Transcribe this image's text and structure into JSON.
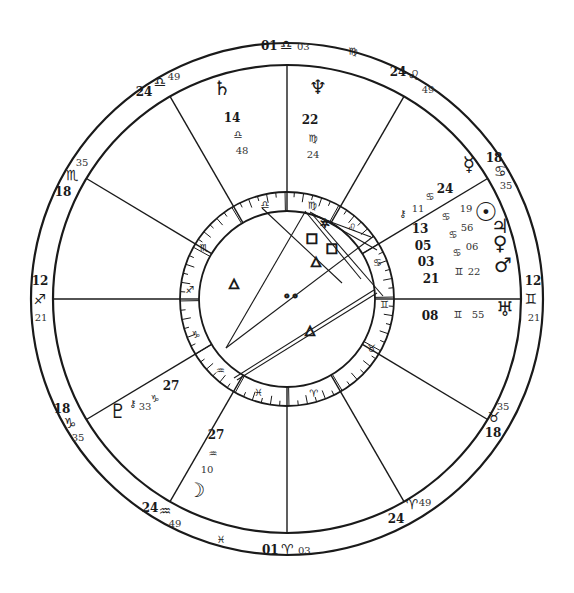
{
  "chart_meta": {
    "type": "natal-wheel",
    "center": [
      287,
      299
    ],
    "radii": {
      "outer": 256,
      "cusp_ring": 234,
      "zodiac_outer": 107,
      "zodiac_inner": 88
    },
    "line_color": "#1a1a1a",
    "background": "#ffffff"
  },
  "house_cusps": [
    {
      "id": "mc",
      "deg": "01",
      "sign": "♎",
      "min": "03",
      "angle": -90
    },
    {
      "id": "c11",
      "deg": "24",
      "sign": "♌",
      "min": "49",
      "angle": -60,
      "deg_pos": [
        398,
        76
      ],
      "sign_pos": [
        414,
        80
      ],
      "min_pos": [
        428,
        93
      ]
    },
    {
      "id": "c12",
      "deg": "18",
      "sign": "♋",
      "min": "35",
      "angle": -31,
      "deg_pos": [
        494,
        162
      ],
      "sign_pos": [
        500,
        176
      ],
      "min_pos": [
        506,
        189
      ]
    },
    {
      "id": "asc",
      "deg": "12",
      "sign": "♊",
      "min": "21",
      "angle": 0,
      "deg_pos": [
        533,
        285
      ],
      "sign_pos": [
        531,
        304
      ],
      "min_pos": [
        534,
        321
      ]
    },
    {
      "id": "c2",
      "deg": "18",
      "sign": "♉",
      "min": "35",
      "angle": 31,
      "deg_pos": [
        493,
        437
      ],
      "sign_pos": [
        494,
        422
      ],
      "min_pos": [
        503,
        410
      ]
    },
    {
      "id": "c3",
      "deg": "24",
      "sign": "♈",
      "min": "49",
      "angle": 60,
      "deg_pos": [
        396,
        523
      ],
      "sign_pos": [
        412,
        509
      ],
      "min_pos": [
        425,
        506
      ]
    },
    {
      "id": "ic",
      "deg": "01",
      "sign": "♈",
      "min": "03",
      "angle": 90
    },
    {
      "id": "c5",
      "deg": "24",
      "sign": "♒",
      "min": "49",
      "angle": 120,
      "deg_pos": [
        150,
        512
      ],
      "sign_pos": [
        165,
        516
      ],
      "min_pos": [
        175,
        527
      ]
    },
    {
      "id": "c6",
      "deg": "18",
      "sign": "♑",
      "min": "35",
      "angle": 149,
      "deg_pos": [
        62,
        413
      ],
      "sign_pos": [
        70,
        428
      ],
      "min_pos": [
        78,
        441
      ]
    },
    {
      "id": "dsc",
      "deg": "12",
      "sign": "♐",
      "min": "21",
      "angle": 180,
      "deg_pos": [
        40,
        285
      ],
      "sign_pos": [
        40,
        304
      ],
      "min_pos": [
        41,
        321
      ]
    },
    {
      "id": "c8",
      "deg": "18",
      "sign": "♏",
      "min": "35",
      "angle": 211,
      "deg_pos": [
        63,
        196
      ],
      "sign_pos": [
        72,
        180
      ],
      "min_pos": [
        82,
        166
      ]
    },
    {
      "id": "c9",
      "deg": "24",
      "sign": "♎",
      "min": "49",
      "angle": 240,
      "deg_pos": [
        144,
        96
      ],
      "sign_pos": [
        160,
        87
      ],
      "min_pos": [
        174,
        80
      ]
    }
  ],
  "top_label": {
    "deg": "01",
    "sign": "♎",
    "min": "03"
  },
  "bottom_label": {
    "deg": "01",
    "sign": "♈",
    "min": "03"
  },
  "intercepted_signs": [
    {
      "sign": "♍",
      "pos": [
        353,
        55
      ]
    },
    {
      "sign": "♓",
      "pos": [
        221,
        543
      ]
    }
  ],
  "planets": [
    {
      "name": "Neptune",
      "glyph": "♆",
      "deg": "22",
      "sign": "♍",
      "min": "24",
      "glyph_pos": [
        318,
        94
      ],
      "deg_pos": [
        310,
        124
      ],
      "sign_pos": [
        313,
        142
      ],
      "min_pos": [
        313,
        158
      ]
    },
    {
      "name": "Saturn",
      "glyph": "♄",
      "deg": "14",
      "sign": "♎",
      "min": "48",
      "glyph_pos": [
        222,
        95
      ],
      "deg_pos": [
        232,
        122
      ],
      "sign_pos": [
        238,
        138
      ],
      "min_pos": [
        242,
        154
      ]
    },
    {
      "name": "Mercury",
      "glyph": "☿",
      "deg": "24",
      "sign": "♋",
      "min": "",
      "glyph_pos": [
        469,
        171
      ],
      "deg_pos": [
        445,
        193
      ],
      "sign_pos": [
        430,
        200
      ],
      "min_pos": null
    },
    {
      "name": "Sun",
      "glyph": "☉",
      "deg": "13",
      "sign": "♋",
      "min": "19",
      "glyph_pos": [
        486,
        221
      ],
      "deg_pos": [
        420,
        233
      ],
      "sign_pos": [
        446,
        220
      ],
      "min_pos": [
        466,
        212
      ]
    },
    {
      "name": "Jupiter",
      "glyph": "♃",
      "deg": "05",
      "sign": "♋",
      "min": "56",
      "glyph_pos": [
        500,
        233
      ],
      "deg_pos": [
        423,
        250
      ],
      "sign_pos": [
        453,
        238
      ],
      "min_pos": [
        467,
        231
      ]
    },
    {
      "name": "Venus",
      "glyph": "♀",
      "deg": "03",
      "sign": "♋",
      "min": "06",
      "glyph_pos": [
        500,
        250
      ],
      "deg_pos": [
        426,
        266
      ],
      "sign_pos": [
        457,
        256
      ],
      "min_pos": [
        472,
        250
      ]
    },
    {
      "name": "Mars",
      "glyph": "♂",
      "deg": "21",
      "sign": "♊",
      "min": "22",
      "glyph_pos": [
        503,
        272
      ],
      "deg_pos": [
        431,
        283
      ],
      "sign_pos": [
        459,
        275
      ],
      "min_pos": [
        474,
        275
      ]
    },
    {
      "name": "Uranus",
      "glyph": "♅",
      "deg": "08",
      "sign": "♊",
      "min": "55",
      "glyph_pos": [
        505,
        316
      ],
      "deg_pos": [
        430,
        320
      ],
      "sign_pos": [
        458,
        318
      ],
      "min_pos": [
        478,
        318
      ]
    },
    {
      "name": "Chiron",
      "glyph": "⚷",
      "deg": "",
      "sign": "",
      "min": "11",
      "glyph_pos": [
        403,
        217
      ],
      "min_pos": [
        418,
        212
      ]
    },
    {
      "name": "Pluto",
      "glyph": "♇",
      "deg": "",
      "sign": "",
      "min": "",
      "glyph_pos": [
        118,
        418
      ]
    },
    {
      "name": "Chiron-2",
      "glyph": "⚷",
      "deg": "",
      "sign": "",
      "min": "",
      "glyph_pos": [
        133,
        407
      ]
    },
    {
      "name": "Node",
      "glyph": "",
      "deg": "27",
      "sign": "♑",
      "min": "33",
      "deg_pos": [
        171,
        390
      ],
      "sign_pos": [
        155,
        402
      ],
      "min_pos": [
        145,
        410
      ]
    },
    {
      "name": "Moon",
      "glyph": "☽",
      "deg": "27",
      "sign": "♒",
      "min": "10",
      "glyph_pos": [
        196,
        497
      ],
      "deg_pos": [
        216,
        439
      ],
      "sign_pos": [
        213,
        457
      ],
      "min_pos": [
        207,
        473
      ]
    }
  ],
  "zodiac_band": [
    {
      "sign": "♎",
      "angle": -103
    },
    {
      "sign": "♍",
      "angle": -75
    },
    {
      "sign": "♌",
      "angle": -48
    },
    {
      "sign": "♋",
      "angle": -22
    },
    {
      "sign": "♊",
      "angle": 3
    },
    {
      "sign": "♉",
      "angle": 30
    },
    {
      "sign": "♈",
      "angle": 74
    },
    {
      "sign": "♓",
      "angle": 107
    },
    {
      "sign": "♒",
      "angle": 133
    },
    {
      "sign": "♑",
      "angle": 159
    },
    {
      "sign": "♐",
      "angle": 186
    },
    {
      "sign": "♏",
      "angle": 212
    }
  ],
  "aspects": [
    {
      "type": "trine",
      "symbol": "△",
      "pos": [
        234,
        287
      ]
    },
    {
      "type": "trine",
      "symbol": "△",
      "pos": [
        316,
        265
      ]
    },
    {
      "type": "square",
      "symbol": "□",
      "pos": [
        312,
        242
      ]
    },
    {
      "type": "square",
      "symbol": "□",
      "pos": [
        332,
        252
      ]
    },
    {
      "type": "sextile",
      "symbol": "✶",
      "pos": [
        325,
        228
      ]
    },
    {
      "type": "opposition",
      "symbol": "∘∘",
      "pos": [
        291,
        300
      ]
    },
    {
      "type": "trine",
      "symbol": "△",
      "pos": [
        310,
        334
      ]
    }
  ]
}
